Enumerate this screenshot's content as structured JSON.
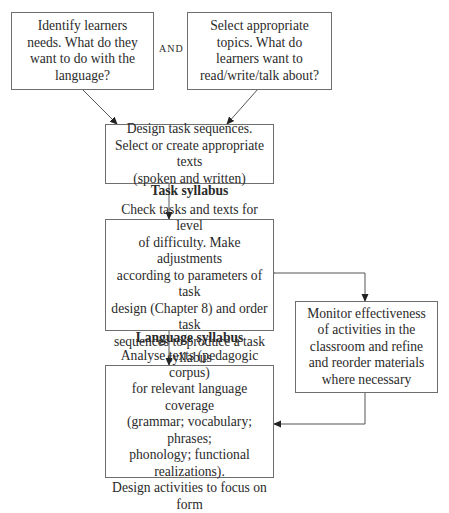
{
  "diagram": {
    "type": "flowchart",
    "nodes": {
      "learner_needs": {
        "text": "Identify learners\nneeds. What do they\nwant to do with the\nlanguage?"
      },
      "connector_and": {
        "text": "AND"
      },
      "select_topics": {
        "text": "Select appropriate\ntopics. What do\nlearners want to\nread/write/talk about?"
      },
      "design_tasks": {
        "text": "Design task sequences.\nSelect or create appropriate texts\n(spoken and written)"
      },
      "task_syllabus": {
        "title": "Task syllabus",
        "text": "Check tasks and texts for level\nof difficulty. Make adjustments\naccording to parameters of task\ndesign (Chapter 8) and order task\nsequences to produce a task syllabus"
      },
      "monitor": {
        "text": "Monitor effectiveness\nof activities in the\nclassroom and refine\nand reorder materials\nwhere necessary"
      },
      "language_syllabus": {
        "title": "Language syllabus",
        "text": "Analyse texts (pedagogic corpus)\nfor relevant language coverage\n(grammar; vocabulary; phrases;\nphonology; functional realizations).\nDesign activities to focus on form"
      }
    },
    "edges": [
      {
        "from": "learner_needs",
        "to": "design_tasks",
        "direction": "one-way"
      },
      {
        "from": "select_topics",
        "to": "design_tasks",
        "direction": "one-way"
      },
      {
        "from": "design_tasks",
        "to": "task_syllabus",
        "direction": "one-way"
      },
      {
        "from": "task_syllabus",
        "to": "language_syllabus",
        "direction": "one-way"
      },
      {
        "from": "task_syllabus",
        "to": "monitor",
        "direction": "two-way"
      },
      {
        "from": "monitor",
        "to": "language_syllabus",
        "direction": "two-way"
      }
    ],
    "colors": {
      "border": "#6e6e6e",
      "line": "#555555",
      "text": "#2a2a2a"
    }
  }
}
